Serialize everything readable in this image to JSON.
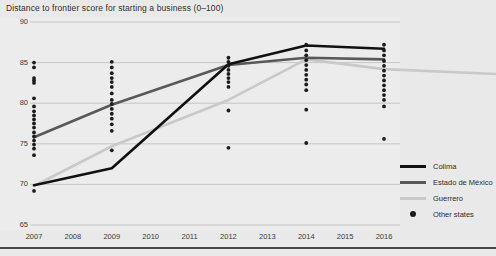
{
  "chart_data": {
    "type": "line",
    "title": "Distance to frontier score for starting a business (0–100)",
    "xlabel": "",
    "ylabel": "",
    "x": [
      2007,
      2008,
      2009,
      2010,
      2011,
      2012,
      2013,
      2014,
      2015,
      2016
    ],
    "xlim": [
      2007,
      2016
    ],
    "ylim": [
      65,
      90
    ],
    "yticks": [
      90,
      85,
      80,
      75,
      70,
      65
    ],
    "xticks": [
      "2007",
      "2008",
      "2009",
      "2010",
      "2011",
      "2012",
      "2013",
      "2014",
      "2015",
      "2016"
    ],
    "grid": "horizontal",
    "legend_position": "right",
    "series": [
      {
        "name": "Colima",
        "color": "#111111",
        "x": [
          2007,
          2009,
          2012,
          2014,
          2016
        ],
        "values": [
          69.9,
          72.0,
          84.8,
          87.1,
          86.7
        ]
      },
      {
        "name": "Estado de México",
        "color": "#595959",
        "x": [
          2007,
          2009,
          2012,
          2014,
          2016
        ],
        "values": [
          75.8,
          79.8,
          84.7,
          85.6,
          85.4
        ]
      },
      {
        "name": "Guerrero",
        "color": "#c9c9c9",
        "x": [
          2007,
          2009,
          2012,
          2014,
          2016
        ],
        "values": [
          69.8,
          74.7,
          80.4,
          85.4,
          84.2
        ]
      }
    ],
    "scatter": {
      "name": "Other states",
      "color": "#1b1b1b",
      "points": [
        {
          "x": 2007,
          "y": 85.0
        },
        {
          "x": 2007,
          "y": 84.4
        },
        {
          "x": 2007,
          "y": 83.1
        },
        {
          "x": 2007,
          "y": 82.8
        },
        {
          "x": 2007,
          "y": 82.5
        },
        {
          "x": 2007,
          "y": 80.6
        },
        {
          "x": 2007,
          "y": 79.6
        },
        {
          "x": 2007,
          "y": 79.0
        },
        {
          "x": 2007,
          "y": 78.5
        },
        {
          "x": 2007,
          "y": 78.0
        },
        {
          "x": 2007,
          "y": 77.5
        },
        {
          "x": 2007,
          "y": 77.0
        },
        {
          "x": 2007,
          "y": 76.4
        },
        {
          "x": 2007,
          "y": 75.9
        },
        {
          "x": 2007,
          "y": 75.4
        },
        {
          "x": 2007,
          "y": 74.9
        },
        {
          "x": 2007,
          "y": 74.4
        },
        {
          "x": 2007,
          "y": 73.6
        },
        {
          "x": 2007,
          "y": 69.2
        },
        {
          "x": 2009,
          "y": 85.1
        },
        {
          "x": 2009,
          "y": 84.4
        },
        {
          "x": 2009,
          "y": 83.7
        },
        {
          "x": 2009,
          "y": 83.1
        },
        {
          "x": 2009,
          "y": 82.6
        },
        {
          "x": 2009,
          "y": 82.0
        },
        {
          "x": 2009,
          "y": 81.2
        },
        {
          "x": 2009,
          "y": 80.4
        },
        {
          "x": 2009,
          "y": 79.9
        },
        {
          "x": 2009,
          "y": 79.3
        },
        {
          "x": 2009,
          "y": 78.7
        },
        {
          "x": 2009,
          "y": 78.1
        },
        {
          "x": 2009,
          "y": 77.4
        },
        {
          "x": 2009,
          "y": 76.6
        },
        {
          "x": 2009,
          "y": 74.2
        },
        {
          "x": 2012,
          "y": 85.6
        },
        {
          "x": 2012,
          "y": 85.1
        },
        {
          "x": 2012,
          "y": 84.6
        },
        {
          "x": 2012,
          "y": 84.1
        },
        {
          "x": 2012,
          "y": 83.6
        },
        {
          "x": 2012,
          "y": 83.1
        },
        {
          "x": 2012,
          "y": 82.6
        },
        {
          "x": 2012,
          "y": 82.0
        },
        {
          "x": 2012,
          "y": 79.1
        },
        {
          "x": 2012,
          "y": 74.5
        },
        {
          "x": 2014,
          "y": 87.2
        },
        {
          "x": 2014,
          "y": 86.5
        },
        {
          "x": 2014,
          "y": 85.9
        },
        {
          "x": 2014,
          "y": 85.3
        },
        {
          "x": 2014,
          "y": 84.7
        },
        {
          "x": 2014,
          "y": 84.1
        },
        {
          "x": 2014,
          "y": 83.5
        },
        {
          "x": 2014,
          "y": 82.9
        },
        {
          "x": 2014,
          "y": 82.3
        },
        {
          "x": 2014,
          "y": 81.6
        },
        {
          "x": 2014,
          "y": 79.2
        },
        {
          "x": 2014,
          "y": 75.1
        },
        {
          "x": 2016,
          "y": 87.2
        },
        {
          "x": 2016,
          "y": 86.5
        },
        {
          "x": 2016,
          "y": 85.9
        },
        {
          "x": 2016,
          "y": 85.2
        },
        {
          "x": 2016,
          "y": 84.6
        },
        {
          "x": 2016,
          "y": 84.0
        },
        {
          "x": 2016,
          "y": 83.4
        },
        {
          "x": 2016,
          "y": 82.8
        },
        {
          "x": 2016,
          "y": 82.2
        },
        {
          "x": 2016,
          "y": 81.6
        },
        {
          "x": 2016,
          "y": 81.0
        },
        {
          "x": 2016,
          "y": 80.4
        },
        {
          "x": 2016,
          "y": 79.6
        },
        {
          "x": 2016,
          "y": 75.6
        }
      ]
    }
  },
  "legend": {
    "items": [
      {
        "label": "Colima",
        "type": "line",
        "color": "#111111"
      },
      {
        "label": "Estado de México",
        "type": "line",
        "color": "#595959"
      },
      {
        "label": "Guerrero",
        "type": "line",
        "color": "#c9c9c9"
      },
      {
        "label": "Other states",
        "type": "dot",
        "color": "#1b1b1b"
      }
    ]
  }
}
